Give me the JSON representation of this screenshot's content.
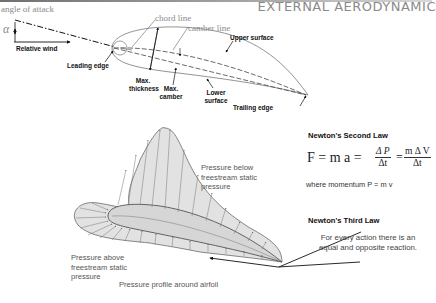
{
  "header": {
    "title": "EXTERNAL AERODYNAMIC"
  },
  "airfoil_diagram": {
    "angle_of_attack_label": "angle of attack",
    "alpha_symbol": "α",
    "labels": {
      "relative_wind": "Relative wind",
      "leading_edge": "Leading edge",
      "chord_line": "chord line",
      "camber_line": "camber line",
      "upper_surface": "Upper surface",
      "max_thickness_1": "Max.",
      "max_thickness_2": "thickness",
      "max_camber_1": "Max.",
      "max_camber_2": "camber",
      "lower_surface_1": "Lower",
      "lower_surface_2": "surface",
      "trailing_edge": "Trailing edge"
    }
  },
  "pressure_diagram": {
    "below_label": [
      "Pressure below",
      "freestream static",
      "pressure"
    ],
    "above_label": [
      "Pressure above",
      "freestream static",
      "pressure"
    ],
    "caption": "Pressure profile around airfoil",
    "fill_color": "#e2e2e2",
    "stroke_color": "#6a6a6a"
  },
  "newton_second": {
    "title": "Newton's Second Law",
    "lhs": "F = m a =",
    "frac1_num": "Δ P",
    "frac1_den": "Δt",
    "equals": "=",
    "frac2_num": "m Δ V",
    "frac2_den": "Δt",
    "momentum_note": "where momentum  P = m v"
  },
  "newton_third": {
    "title": "Newton's Third Law",
    "line1": "For every action there is an",
    "line2": "equal and opposite reaction."
  }
}
